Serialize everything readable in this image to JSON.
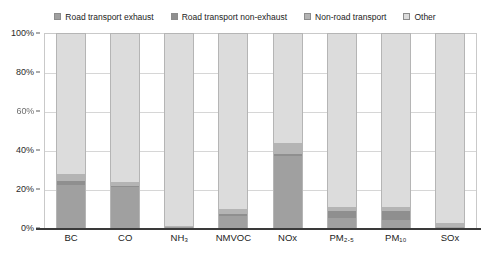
{
  "chart_data": {
    "type": "bar",
    "subtype": "stacked-percentage",
    "title": "",
    "subtitle": "",
    "xlabel": "",
    "ylabel": "",
    "ylim": [
      0,
      100
    ],
    "yticks": [
      0,
      20,
      40,
      60,
      80,
      100
    ],
    "ytick_labels": [
      "0%",
      "20%",
      "40%",
      "60%",
      "80%",
      "100%"
    ],
    "grid": true,
    "legend_position": "top-center",
    "categories": [
      "BC",
      "CO",
      "NH3",
      "NMVOC",
      "NOx",
      "PM2.5",
      "PM10",
      "SOx"
    ],
    "category_labels": [
      "BC",
      "CO",
      "NH₃",
      "NMVOC",
      "NOx",
      "PM₂.₅",
      "PM₁₀",
      "SOx"
    ],
    "series": [
      {
        "name": "Road transport exhaust",
        "color": "#a0a0a0",
        "values": [
          22,
          21,
          0.6,
          6,
          37,
          5,
          4,
          0.5
        ]
      },
      {
        "name": "Road transport non-exhaust",
        "color": "#8f8f8f",
        "values": [
          2,
          0.6,
          0,
          1,
          1,
          4,
          5,
          0
        ]
      },
      {
        "name": "Non-road transport",
        "color": "#b4b4b4",
        "values": [
          4,
          2,
          0.2,
          3,
          6,
          2,
          2,
          2
        ]
      },
      {
        "name": "Other",
        "color": "#dcdcdc",
        "values": [
          72,
          76.4,
          99.2,
          90,
          56,
          89,
          89,
          97.5
        ]
      }
    ]
  },
  "legend": {
    "entries": [
      {
        "label": "Road transport exhaust",
        "color": "#a0a0a0"
      },
      {
        "label": "Road transport non-exhaust",
        "color": "#8f8f8f"
      },
      {
        "label": "Non-road transport",
        "color": "#b4b4b4"
      },
      {
        "label": "Other",
        "color": "#dcdcdc"
      }
    ]
  },
  "axes": {
    "y": {
      "labels": [
        "100%",
        "80%",
        "60%",
        "40%",
        "20%",
        "0%"
      ],
      "values": [
        100,
        80,
        60,
        40,
        20,
        0
      ]
    },
    "x": {
      "labels": [
        "BC",
        "CO",
        "NH₃",
        "NMVOC",
        "NOx",
        "PM₂.₅",
        "PM₁₀",
        "SOx"
      ]
    }
  },
  "colors": {
    "exhaust": "#a0a0a0",
    "non_exhaust": "#8f8f8f",
    "non_road": "#b4b4b4",
    "other": "#dcdcdc",
    "grid": "#d6d6d6",
    "axis": "#3a3a3a",
    "background": "#ffffff"
  }
}
